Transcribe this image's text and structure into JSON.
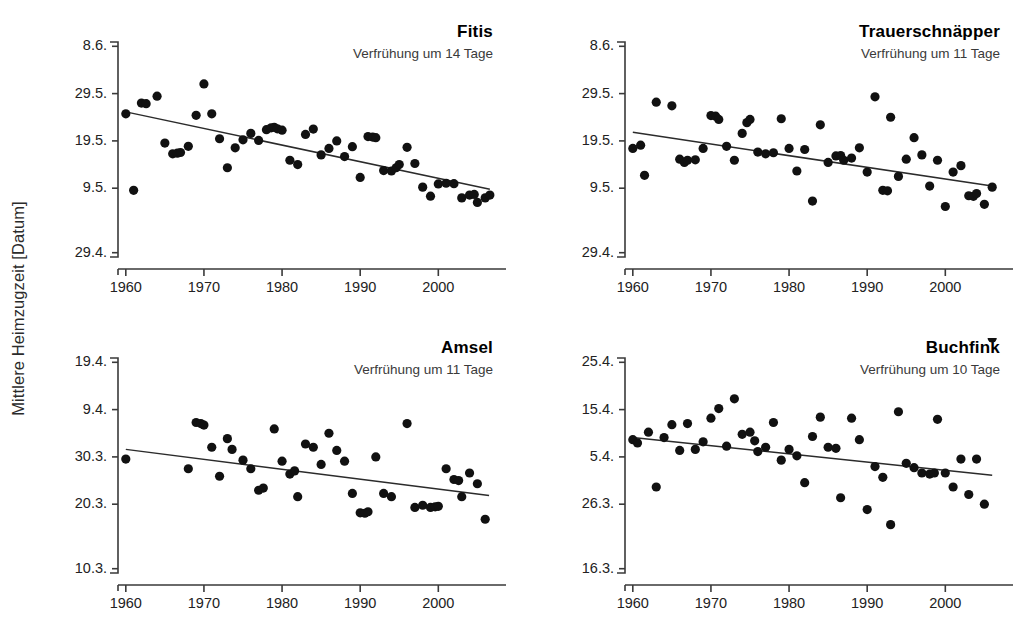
{
  "figure": {
    "ylabel": "Mittlere Heimzugzeit  [Datum]",
    "series_color": "#111111",
    "trend_color": "#2b2b2b",
    "axis_color": "#3a3a3a",
    "background": "#ffffff"
  },
  "chart_data": [
    {
      "type": "scatter",
      "title": "Fitis",
      "subtitle": "Verfrühung um 14 Tage",
      "xlabel": "",
      "ylabel": "Mittlere Heimzugzeit  [Datum]",
      "xlim": [
        1959,
        2007
      ],
      "ylim": [
        0,
        100
      ],
      "grid": false,
      "legend": "none",
      "xticks": [
        1960,
        1970,
        1980,
        1990,
        2000
      ],
      "xticklabels": [
        "1960",
        "1970",
        "1980",
        "1990",
        "2000"
      ],
      "yticks": [
        98,
        76,
        54,
        32,
        2
      ],
      "yticklabels": [
        "8.6.",
        "29.5.",
        "19.5.",
        "9.5.",
        "29.4."
      ],
      "x": [
        1960,
        1961,
        1962,
        1962.6,
        1964,
        1965,
        1966,
        1966.6,
        1967,
        1968,
        1969,
        1970,
        1971,
        1972,
        1973,
        1974,
        1975,
        1976,
        1977,
        1978,
        1978.6,
        1979,
        1979.4,
        1980,
        1981,
        1982,
        1983,
        1984,
        1985,
        1986,
        1987,
        1988,
        1989,
        1990,
        1991,
        1991.6,
        1992,
        1993,
        1994,
        1994.6,
        1995,
        1996,
        1997,
        1998,
        1999,
        2000,
        2001,
        2002,
        2003,
        2004,
        2004.6,
        2005,
        2006,
        2006.6
      ],
      "y": [
        66.6,
        31.0,
        71.6,
        71.3,
        74.8,
        53.0,
        48.0,
        48.3,
        48.6,
        51.5,
        65.9,
        80.5,
        66.6,
        55.0,
        41.5,
        50.8,
        54.5,
        57.5,
        54.2,
        59.2,
        60.1,
        60.3,
        59.6,
        59.0,
        45.0,
        43.0,
        57.0,
        59.5,
        47.5,
        50.5,
        54.0,
        46.7,
        51.3,
        37.0,
        56.0,
        55.8,
        55.5,
        40.2,
        40.0,
        41.5,
        43.0,
        51.0,
        43.5,
        32.5,
        28.3,
        34.0,
        34.3,
        34.1,
        27.5,
        28.8,
        29.1,
        25.4,
        27.5,
        28.8
      ],
      "trend": {
        "x": [
          1960,
          2006.6
        ],
        "y": [
          67.5,
          31.5
        ]
      }
    },
    {
      "type": "scatter",
      "title": "Trauerschnäpper",
      "subtitle": "Verfrühung um 11 Tage",
      "xlabel": "",
      "ylabel": "",
      "xlim": [
        1959,
        2007
      ],
      "ylim": [
        0,
        100
      ],
      "grid": false,
      "legend": "none",
      "xticks": [
        1960,
        1970,
        1980,
        1990,
        2000
      ],
      "xticklabels": [
        "1960",
        "1970",
        "1980",
        "1990",
        "2000"
      ],
      "yticks": [
        98,
        76,
        54,
        32,
        2
      ],
      "yticklabels": [
        "8.6.",
        "29.5.",
        "19.5.",
        "9.5.",
        "29.4."
      ],
      "x": [
        1960,
        1961,
        1961.5,
        1963,
        1965,
        1966,
        1966.6,
        1967,
        1968,
        1969,
        1970,
        1970.6,
        1971,
        1972,
        1973,
        1974,
        1974.6,
        1975,
        1976,
        1977,
        1978,
        1979,
        1980,
        1981,
        1982,
        1983,
        1984,
        1985,
        1986,
        1986.6,
        1987,
        1988,
        1989,
        1990,
        1991,
        1992,
        1992.6,
        1993,
        1994,
        1995,
        1996,
        1997,
        1998,
        1999,
        2000,
        2001,
        2002,
        2003,
        2003.6,
        2004,
        2005,
        2006
      ],
      "y": [
        50.5,
        52.0,
        38.0,
        72.0,
        70.3,
        45.5,
        44.0,
        45.0,
        45.2,
        50.5,
        65.8,
        65.5,
        64.0,
        51.5,
        45.0,
        57.5,
        62.5,
        64.0,
        48.8,
        48.0,
        48.5,
        64.3,
        50.5,
        40.0,
        50.0,
        26.0,
        61.5,
        44.0,
        47.0,
        47.2,
        45.0,
        46.0,
        50.8,
        39.5,
        74.5,
        31.0,
        30.8,
        65.0,
        37.5,
        45.5,
        55.5,
        47.5,
        33.0,
        45.0,
        23.5,
        39.5,
        42.5,
        28.5,
        28.2,
        29.5,
        24.5,
        32.5
      ],
      "trend": {
        "x": [
          1960,
          2006
        ],
        "y": [
          58.0,
          33.0
        ]
      }
    },
    {
      "type": "scatter",
      "title": "Amsel",
      "subtitle": "Verfrühung um 11 Tage",
      "xlabel": "",
      "ylabel": "",
      "xlim": [
        1959,
        2007
      ],
      "ylim": [
        0,
        100
      ],
      "grid": false,
      "legend": "none",
      "xticks": [
        1960,
        1970,
        1980,
        1990,
        2000
      ],
      "xticklabels": [
        "1960",
        "1970",
        "1980",
        "1990",
        "2000"
      ],
      "yticks": [
        98,
        76,
        54,
        32,
        2
      ],
      "yticklabels": [
        "19.4.",
        "9.4.",
        "30.3.",
        "20.3.",
        "10.3."
      ],
      "x": [
        1960,
        1968,
        1969,
        1969.6,
        1970,
        1971,
        1972,
        1973,
        1973.6,
        1975,
        1976,
        1977,
        1977.6,
        1979,
        1980,
        1981,
        1981.6,
        1982,
        1983,
        1984,
        1985,
        1986,
        1987,
        1988,
        1989,
        1990,
        1990.6,
        1991,
        1992,
        1993,
        1994,
        1996,
        1997,
        1998,
        1999,
        1999.6,
        2000,
        2001,
        2002,
        2002.6,
        2003,
        2004,
        2005,
        2006
      ],
      "y": [
        53.0,
        48.5,
        70.0,
        69.5,
        68.8,
        58.5,
        45.0,
        62.5,
        57.5,
        52.5,
        48.5,
        38.5,
        39.5,
        67.0,
        52.0,
        46.0,
        47.5,
        35.5,
        60.0,
        58.5,
        50.5,
        65.0,
        57.0,
        52.0,
        37.0,
        28.0,
        27.8,
        28.5,
        54.0,
        37.0,
        35.5,
        69.5,
        30.5,
        31.5,
        30.5,
        30.8,
        31.0,
        48.5,
        43.5,
        43.0,
        35.5,
        46.5,
        41.5,
        25.0
      ],
      "trend": {
        "x": [
          1960,
          2006.5
        ],
        "y": [
          57.5,
          36.0
        ]
      }
    },
    {
      "type": "scatter",
      "title": "Buchfink",
      "subtitle": "Verfrühung um 10 Tage",
      "xlabel": "",
      "ylabel": "",
      "xlim": [
        1959,
        2007
      ],
      "ylim": [
        0,
        100
      ],
      "grid": false,
      "legend": "none",
      "xticks": [
        1960,
        1970,
        1980,
        1990,
        2000
      ],
      "xticklabels": [
        "1960",
        "1970",
        "1980",
        "1990",
        "2000"
      ],
      "yticks": [
        98,
        76,
        54,
        32,
        2
      ],
      "yticklabels": [
        "25.4.",
        "15.4.",
        "5.4.",
        "26.3.",
        "16.3."
      ],
      "x": [
        1960,
        1960.6,
        1962,
        1963,
        1964,
        1965,
        1966,
        1967,
        1968,
        1969,
        1970,
        1971,
        1972,
        1973,
        1974,
        1975,
        1975.6,
        1976,
        1977,
        1978,
        1979,
        1980,
        1981,
        1982,
        1983,
        1984,
        1985,
        1986,
        1986.6,
        1988,
        1989,
        1990,
        1991,
        1992,
        1993,
        1994,
        1995,
        1996,
        1997,
        1998,
        1998.6,
        1999,
        2000,
        2001,
        2002,
        2003,
        2004,
        2005,
        2006
      ],
      "y": [
        62.0,
        60.5,
        65.5,
        40.0,
        63.0,
        69.0,
        57.0,
        69.5,
        57.5,
        61.0,
        72.0,
        76.5,
        59.0,
        81.0,
        64.5,
        65.5,
        61.5,
        56.5,
        58.5,
        70.0,
        52.5,
        57.5,
        54.5,
        42.0,
        63.5,
        72.5,
        58.5,
        58.0,
        35.0,
        72.0,
        62.0,
        29.5,
        49.5,
        44.5,
        22.5,
        75.0,
        51.0,
        49.0,
        46.5,
        46.0,
        46.5,
        71.5,
        46.5,
        40.0,
        53.0,
        36.5,
        53.0,
        32.0
      ],
      "trend": {
        "x": [
          1960,
          2006
        ],
        "y": [
          63.0,
          45.5
        ]
      }
    }
  ]
}
